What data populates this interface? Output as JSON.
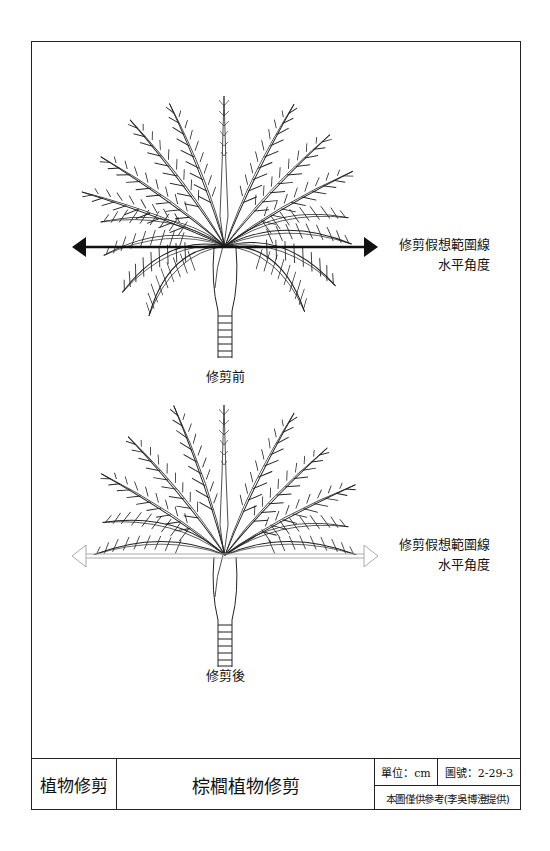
{
  "diagrams": {
    "before": {
      "caption": "修剪前",
      "range_line_label": "修剪假想範圍線",
      "angle_label": "水平角度",
      "arrow_style": "solid"
    },
    "after": {
      "caption": "修剪後",
      "range_line_label": "修剪假想範圍線",
      "angle_label": "水平角度",
      "arrow_style": "outline"
    }
  },
  "title_block": {
    "category": "植物修剪",
    "title": "棕櫚植物修剪",
    "unit": "單位：cm",
    "drawing_number": "圖號：2-29-3",
    "note": "本圖僅供參考(李吳博澄提供)"
  },
  "colors": {
    "line": "#222222",
    "outline_arrow": "#bbbbbb",
    "background": "#ffffff"
  }
}
